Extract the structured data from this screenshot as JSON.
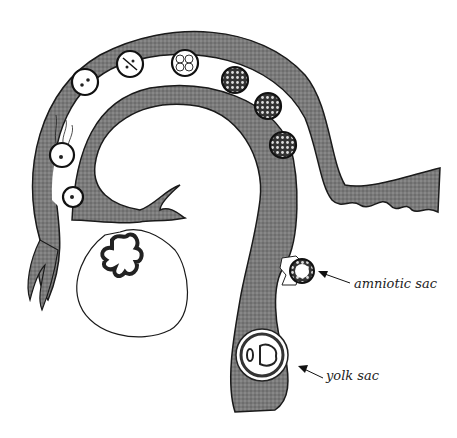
{
  "figure": {
    "colors": {
      "tissue": "#6e6e6e",
      "outline": "#1a1a1a",
      "background": "#ffffff"
    }
  },
  "labels": {
    "amniotic_sac": "amniotic sac",
    "yolk_sac": "yolk sac"
  },
  "stages": [
    {
      "name": "ovum",
      "icon": "ovum-icon"
    },
    {
      "name": "fertilization",
      "icon": "sperm-icon"
    },
    {
      "name": "pronuclei",
      "icon": "zygote-icon"
    },
    {
      "name": "2-cell",
      "icon": "two-cell-icon"
    },
    {
      "name": "4-cell",
      "icon": "four-cell-icon"
    },
    {
      "name": "8-cell",
      "icon": "eight-cell-icon"
    },
    {
      "name": "morula",
      "icon": "morula-icon"
    },
    {
      "name": "blastocyst",
      "icon": "blastocyst-icon"
    }
  ]
}
